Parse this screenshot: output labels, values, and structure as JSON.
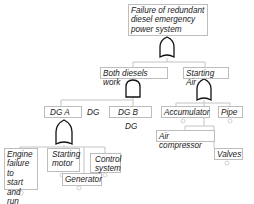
{
  "diagram": {
    "type": "fault-tree",
    "top_event": "Failure of redundant\ndiesel emergency\npower system",
    "nodes": {
      "both_diesels": "Both diesels work",
      "starting_air": "Starting Air",
      "dg_a": "DG A",
      "dg_a_tag": "DG",
      "dg_b": "DG B",
      "dg_b_tag": "DG",
      "accumulator": "Accumulator",
      "pipe": "Pipe",
      "air_compressor": "Air compressor",
      "valves": "Valves",
      "engine_failure": "Engine\nfailure to\nstart and\nrun",
      "starting_motor": "Starting\nmotor",
      "control_system": "Control\nsystem",
      "generator": "Generator"
    },
    "gates": {
      "top": "OR",
      "both_diesels": "AND",
      "starting_air": "OR",
      "dg_a": "OR"
    },
    "colors": {
      "line": "#bdbdbd",
      "gate": "#111111",
      "text": "#1a1a1a"
    }
  }
}
